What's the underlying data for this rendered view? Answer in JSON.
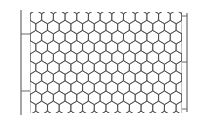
{
  "diagram": {
    "type": "hexagonal-wire-mesh",
    "colors": {
      "background": "#ffffff",
      "mesh_stroke": "#3a3a3a",
      "post_stroke": "#6a6a6a"
    },
    "mesh": {
      "left": 30,
      "right": 182,
      "top": 12,
      "bottom": 113,
      "columns": 13,
      "rows": 10
    },
    "left_post": {
      "x": 21,
      "top": 10,
      "bottom": 115,
      "ties_y": [
        34,
        91
      ]
    },
    "right_post": {
      "x": 187,
      "top": 13,
      "bottom": 112,
      "ties_y": [
        16,
        62,
        109
      ]
    }
  }
}
